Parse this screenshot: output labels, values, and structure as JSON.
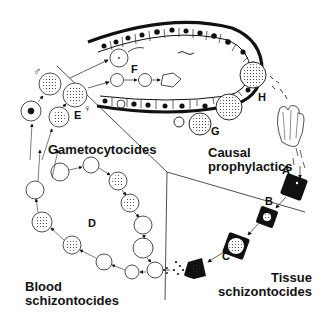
{
  "diagram": {
    "type": "malaria-parasite-life-cycle-drug-targets",
    "regions": [
      {
        "id": "gametocytocides",
        "label": "Gametocytocides"
      },
      {
        "id": "causal",
        "label_line1": "Causal",
        "label_line2": "prophylactics"
      },
      {
        "id": "tissue",
        "label_line1": "Tissue",
        "label_line2": "schizontocides"
      },
      {
        "id": "blood",
        "label_line1": "Blood",
        "label_line2": "schizontocides"
      }
    ],
    "stage_letters": {
      "A": "A",
      "B": "B",
      "C": "C",
      "D": "D",
      "E": "E",
      "F": "F",
      "G": "G",
      "H": "H"
    },
    "symbols": {
      "male": "♂",
      "female": "♀"
    },
    "colors": {
      "ink": "#111111",
      "background": "#ffffff"
    }
  }
}
